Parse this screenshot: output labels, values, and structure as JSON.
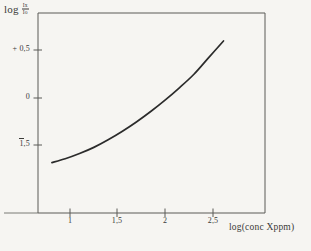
{
  "figure": {
    "background_color": "#f6f5f2",
    "ink_color": "#3a3a38",
    "curve_color": "#2b2b2b"
  },
  "axis_titles": {
    "y_prefix": "log",
    "y_fraction_numerator": "Ix",
    "y_fraction_denominator": "Io",
    "x": "log(conc Xppm)"
  },
  "ticks": {
    "y": [
      {
        "label": "+ 0,5",
        "value": 0.5,
        "negative": false
      },
      {
        "label": "0",
        "value": 0,
        "negative": false
      },
      {
        "label": "1,5",
        "value": -1.5,
        "negative": true
      }
    ],
    "x": [
      {
        "label": "1",
        "value": 1
      },
      {
        "label": "1,5",
        "value": 1.5
      },
      {
        "label": "2",
        "value": 2
      },
      {
        "label": "2,5",
        "value": 2.5
      }
    ]
  },
  "chart_data": {
    "type": "line",
    "title": "",
    "xlabel": "log(conc Xppm)",
    "ylabel": "log Ix/Io",
    "xlim": [
      0.66,
      3.04
    ],
    "ylim": [
      -2.62,
      0.93
    ],
    "grid": false,
    "legend": null,
    "series": [
      {
        "name": "calibration curve",
        "x": [
          0.81,
          0.95,
          1.1,
          1.25,
          1.4,
          1.55,
          1.7,
          1.85,
          2.0,
          2.15,
          2.3,
          2.45,
          2.61
        ],
        "y": [
          -1.87,
          -1.79,
          -1.68,
          -1.55,
          -1.39,
          -1.21,
          -1.01,
          -0.79,
          -0.55,
          -0.29,
          -0.01,
          0.33,
          0.69
        ]
      }
    ]
  }
}
